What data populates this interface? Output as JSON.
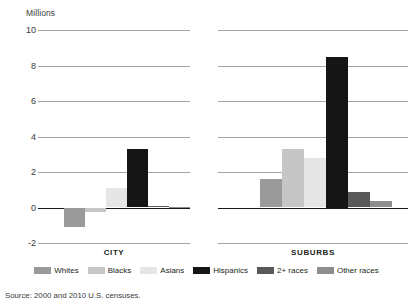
{
  "chart_data": {
    "type": "bar",
    "title": "",
    "unit_label": "Millions",
    "ylabel": "Millions",
    "xlabel": "",
    "ylim": [
      -2,
      10
    ],
    "yticks": [
      10,
      8,
      6,
      4,
      2,
      0,
      -2
    ],
    "ytick_labels": [
      "10",
      "8",
      "6",
      "4",
      "2",
      "0",
      "-2"
    ],
    "grid": true,
    "legend_position": "bottom",
    "panels": [
      "CITY",
      "SUBURBS"
    ],
    "categories": [
      "CITY",
      "SUBURBS"
    ],
    "series": [
      {
        "name": "Whites",
        "color": "#9a9a9a",
        "values": [
          -1.1,
          1.6
        ]
      },
      {
        "name": "Blacks",
        "color": "#c6c6c6",
        "values": [
          -0.25,
          3.3
        ]
      },
      {
        "name": "Asians",
        "color": "#e6e6e6",
        "values": [
          1.1,
          2.8
        ]
      },
      {
        "name": "Hispanics",
        "color": "#151515",
        "values": [
          3.3,
          8.5
        ]
      },
      {
        "name": "2+ races",
        "color": "#595959",
        "values": [
          0.08,
          0.85
        ]
      },
      {
        "name": "Other races",
        "color": "#8e8e8e",
        "values": [
          0.05,
          0.35
        ]
      }
    ],
    "source": "Source: 2000 and 2010 U.S. censuses."
  },
  "axis": {
    "unit": "Millions",
    "ticks": [
      {
        "label": "10",
        "value": 10
      },
      {
        "label": "8",
        "value": 8
      },
      {
        "label": "6",
        "value": 6
      },
      {
        "label": "4",
        "value": 4
      },
      {
        "label": "2",
        "value": 2
      },
      {
        "label": "0",
        "value": 0
      },
      {
        "label": "-2",
        "value": -2
      }
    ]
  },
  "panels": [
    {
      "id": "city",
      "title": "CITY",
      "bars": [
        {
          "series": "Whites",
          "value": -1.1,
          "color": "#9a9a9a"
        },
        {
          "series": "Blacks",
          "value": -0.25,
          "color": "#c6c6c6"
        },
        {
          "series": "Asians",
          "value": 1.1,
          "color": "#e6e6e6"
        },
        {
          "series": "Hispanics",
          "value": 3.3,
          "color": "#151515"
        },
        {
          "series": "2+ races",
          "value": 0.08,
          "color": "#595959"
        },
        {
          "series": "Other races",
          "value": 0.05,
          "color": "#8e8e8e"
        }
      ]
    },
    {
      "id": "suburbs",
      "title": "SUBURBS",
      "bars": [
        {
          "series": "Whites",
          "value": 1.6,
          "color": "#9a9a9a"
        },
        {
          "series": "Blacks",
          "value": 3.3,
          "color": "#c6c6c6"
        },
        {
          "series": "Asians",
          "value": 2.8,
          "color": "#e6e6e6"
        },
        {
          "series": "Hispanics",
          "value": 8.5,
          "color": "#151515"
        },
        {
          "series": "2+ races",
          "value": 0.85,
          "color": "#595959"
        },
        {
          "series": "Other races",
          "value": 0.35,
          "color": "#8e8e8e"
        }
      ]
    }
  ],
  "legend": {
    "items": [
      {
        "label": "Whites",
        "color": "#9a9a9a"
      },
      {
        "label": "Blacks",
        "color": "#c6c6c6"
      },
      {
        "label": "Asians",
        "color": "#e6e6e6"
      },
      {
        "label": "Hispanics",
        "color": "#151515"
      },
      {
        "label": "2+ races",
        "color": "#595959"
      },
      {
        "label": "Other races",
        "color": "#8e8e8e"
      }
    ]
  },
  "source": {
    "text": "Source: 2000 and 2010 U.S. censuses."
  }
}
